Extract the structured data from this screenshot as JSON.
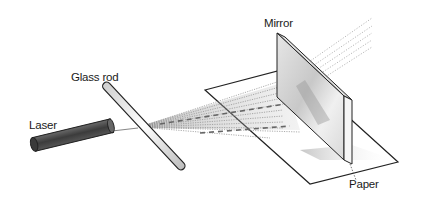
{
  "diagram": {
    "type": "physics-apparatus",
    "labels": {
      "laser": "Laser",
      "glass_rod": "Glass rod",
      "mirror": "Mirror",
      "paper": "Paper"
    },
    "components": [
      {
        "id": "laser",
        "label": "Laser",
        "shape": "dark cylinder"
      },
      {
        "id": "glass_rod",
        "label": "Glass rod",
        "shape": "transparent slanted rod"
      },
      {
        "id": "light_fan",
        "label": "",
        "shape": "dotted fan of rays"
      },
      {
        "id": "paper",
        "label": "Paper",
        "shape": "parallelogram sheet"
      },
      {
        "id": "mirror",
        "label": "Mirror",
        "shape": "vertical plate"
      }
    ],
    "colors": {
      "ink": "#1a1a1a",
      "laser_body": "#4a4a4a",
      "ray": "#8a8a8a",
      "mirror_light": "#f2f2f2",
      "mirror_dark": "#9a9a9a"
    }
  }
}
